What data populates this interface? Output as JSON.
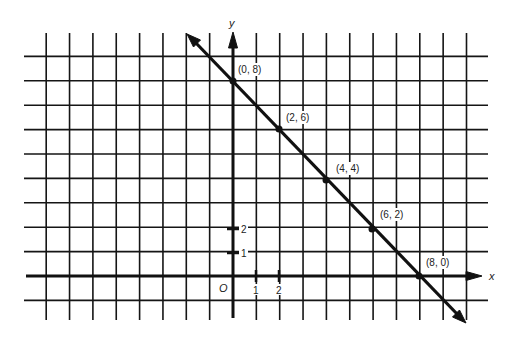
{
  "chart_data": {
    "type": "line",
    "title": "",
    "xlabel": "x",
    "ylabel": "y",
    "origin_label": "O",
    "x_tick_labels": [
      "1",
      "2"
    ],
    "y_tick_labels": [
      "1",
      "2"
    ],
    "grid": true,
    "xlim": [
      -8,
      10
    ],
    "ylim": [
      -1,
      9
    ],
    "series": [
      {
        "name": "line x + y = 8",
        "x": [
          0,
          2,
          4,
          6,
          8
        ],
        "y": [
          8,
          6,
          4,
          2,
          0
        ]
      }
    ],
    "point_labels": [
      "(0, 8)",
      "(2, 6)",
      "(4, 4)",
      "(6, 2)",
      "(8, 0)"
    ],
    "line_color": "#111111",
    "grid_color": "#111111"
  },
  "labels": {
    "x_axis": "x",
    "y_axis": "y",
    "origin": "O",
    "x_tick_1": "1",
    "x_tick_2": "2",
    "y_tick_1": "1",
    "y_tick_2": "2",
    "p0": "(0, 8)",
    "p1": "(2, 6)",
    "p2": "(4, 4)",
    "p3": "(6, 2)",
    "p4": "(8, 0)"
  }
}
